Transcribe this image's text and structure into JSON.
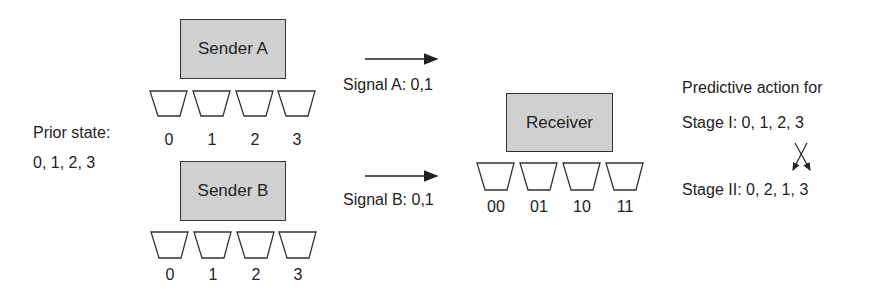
{
  "prior_state": {
    "label": "Prior state:",
    "values": "0, 1, 2, 3"
  },
  "sender_a": {
    "label": "Sender A",
    "urns": [
      "0",
      "1",
      "2",
      "3"
    ]
  },
  "sender_b": {
    "label": "Sender B",
    "urns": [
      "0",
      "1",
      "2",
      "3"
    ]
  },
  "signal_a": {
    "label": "Signal A: 0,1"
  },
  "signal_b": {
    "label": "Signal B: 0,1"
  },
  "receiver": {
    "label": "Receiver",
    "urns": [
      "00",
      "01",
      "10",
      "11"
    ]
  },
  "predictive_action": {
    "title": "Predictive action for",
    "stage_1": "Stage I: 0, 1, 2, 3",
    "stage_2": "Stage II: 0, 2, 1, 3"
  },
  "colors": {
    "box_fill": "#d0d0d0",
    "stroke": "#333333",
    "text": "#222222"
  }
}
